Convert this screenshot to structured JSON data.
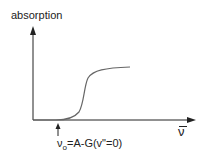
{
  "diagram": {
    "y_axis_label": "absorption",
    "x_axis_symbol": "ν",
    "annotation": {
      "nu": "ν",
      "subscript": "o",
      "rest": "=A-G(v\"=0)"
    },
    "colors": {
      "axes": "#222222",
      "curve": "#666666",
      "background": "#ffffff"
    },
    "curve_description": "sigmoid absorption onset starting at ν_o and leveling off"
  }
}
